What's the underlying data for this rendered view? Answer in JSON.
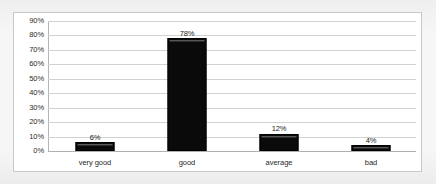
{
  "chart_data": {
    "type": "bar",
    "title": "",
    "subtitle": "",
    "xlabel": "",
    "ylabel": "",
    "categories": [
      "very good",
      "good",
      "average",
      "bad"
    ],
    "values": [
      6,
      78,
      12,
      4
    ],
    "value_labels": [
      "6%",
      "78%",
      "12%",
      "4%"
    ],
    "ylim": [
      0,
      90
    ],
    "y_tick_step": 10,
    "y_tick_labels": [
      "0%",
      "10%",
      "20%",
      "30%",
      "40%",
      "50%",
      "60%",
      "70%",
      "80%",
      "90%"
    ],
    "grid": true,
    "legend": false,
    "legend_position": "none",
    "series": [
      {
        "name": "",
        "values": [
          6,
          78,
          12,
          4
        ],
        "color": "#0a0a0a"
      }
    ]
  },
  "colors": {
    "bar": "#0a0a0a",
    "bar_highlight": "#6e6e6e",
    "gridline": "#d2d2d2",
    "axis_line": "#b0b0b0",
    "frame_border": "#c8c8c8",
    "plot_background": "#ffffff",
    "page_background": "#f3f3f3",
    "tick_text": "#2b2b2b",
    "label_text": "#1f1f1f"
  }
}
